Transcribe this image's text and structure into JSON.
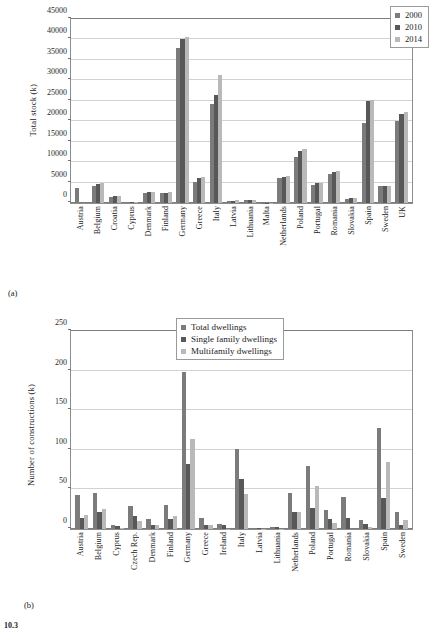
{
  "figure": {
    "number_label": "10.3",
    "caption_a": "(a)",
    "caption_b": "(b)"
  },
  "chart_data": [
    {
      "id": "a",
      "type": "bar",
      "title": "",
      "xlabel": "",
      "ylabel": "Total stock (k)",
      "ylim": [
        0,
        45000
      ],
      "ytick_step": 5000,
      "yticks": [
        "0",
        "5000",
        "10000",
        "15000",
        "20000",
        "25000",
        "30000",
        "35000",
        "40000",
        "45000"
      ],
      "grid": true,
      "legend_position": "top-right",
      "categories": [
        "Austria",
        "Belgium",
        "Croatia",
        "Cyprus",
        "Denmark",
        "Finland",
        "Germany",
        "Greece",
        "Italy",
        "Latvia",
        "Lithuania",
        "Malta",
        "Netherlands",
        "Poland",
        "Portugal",
        "Romania",
        "Slovakia",
        "Spain",
        "Sweden",
        "UK"
      ],
      "series": [
        {
          "name": "2000",
          "color": "#7b7b7b",
          "values": [
            3750,
            4050,
            1550,
            200,
            2500,
            2350,
            37900,
            5150,
            24250,
            550,
            750,
            60,
            6000,
            11150,
            4350,
            7000,
            1100,
            19550,
            4150,
            20100
          ]
        },
        {
          "name": "2010",
          "color": "#585858",
          "values": [
            0,
            4600,
            1600,
            280,
            2650,
            2550,
            40050,
            6200,
            26450,
            600,
            830,
            90,
            6450,
            12700,
            4800,
            7600,
            1150,
            24850,
            4250,
            21700
          ]
        },
        {
          "name": "2014",
          "color": "#b9b9b9",
          "values": [
            0,
            4850,
            1620,
            300,
            2700,
            2600,
            40700,
            6350,
            31200,
            620,
            850,
            100,
            6700,
            13150,
            5000,
            7850,
            1180,
            25200,
            4250,
            22350
          ]
        }
      ]
    },
    {
      "id": "b",
      "type": "bar",
      "title": "",
      "xlabel": "",
      "ylabel": "Number of constructions (k)",
      "ylim": [
        0,
        250
      ],
      "ytick_step": 50,
      "yticks": [
        "0",
        "50",
        "100",
        "150",
        "200",
        "250"
      ],
      "grid": true,
      "legend_position": "top-center",
      "categories": [
        "Austria",
        "Belgium",
        "Cyprus",
        "Czech Rep.",
        "Denmark",
        "Finland",
        "Germany",
        "Greece",
        "Ireland",
        "Italy",
        "Latvia",
        "Lithuania",
        "Netherlands",
        "Poland",
        "Portugal",
        "Romania",
        "Slovakia",
        "Spain",
        "Sweden"
      ],
      "series": [
        {
          "name": "Total dwellings",
          "color": "#7b7b7b",
          "values": [
            43,
            46,
            4.5,
            29,
            13,
            30,
            198,
            14,
            6,
            101,
            1.5,
            2.5,
            45,
            79,
            24,
            40,
            11,
            128,
            21
          ]
        },
        {
          "name": "Single family dwellings",
          "color": "#585858",
          "values": [
            14,
            22,
            4,
            17,
            5,
            13,
            82,
            5,
            5.5,
            63,
            1.2,
            2,
            22,
            26,
            13,
            14,
            6,
            39,
            5
          ]
        },
        {
          "name": "Multifamily dwellings",
          "color": "#b9b9b9",
          "values": [
            18,
            25,
            1.5,
            10,
            5,
            16,
            114,
            5,
            0.6,
            44,
            0.5,
            0.6,
            22,
            54,
            8,
            0,
            3,
            84,
            11
          ]
        }
      ]
    }
  ]
}
